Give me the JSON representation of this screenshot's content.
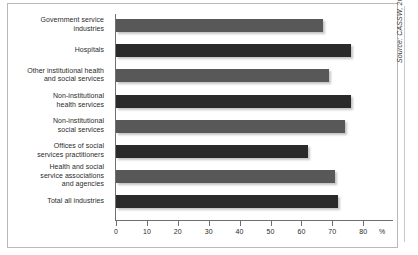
{
  "chart_data": {
    "type": "bar",
    "orientation": "horizontal",
    "title": "",
    "xlabel": "%",
    "ylabel": "",
    "xlim": [
      0,
      80
    ],
    "grid": false,
    "legend": null,
    "tick_labels": [
      "0",
      "10",
      "20",
      "30",
      "40",
      "50",
      "60",
      "70",
      "80"
    ],
    "tick_values": [
      0,
      10,
      20,
      30,
      40,
      50,
      60,
      70,
      80
    ],
    "axis_unit_symbol": "%",
    "categories": [
      "Government service industries",
      "Hospitals",
      "Other institutional health and social services",
      "Non-institutional health services",
      "Non-institutional social services",
      "Offices of social services practitioners",
      "Health and social service associations and agencies",
      "Total all industries"
    ],
    "category_lines": [
      [
        "Government service",
        "industries"
      ],
      [
        "Hospitals"
      ],
      [
        "Other institutional health",
        "and social services"
      ],
      [
        "Non-institutional",
        "health services"
      ],
      [
        "Non-institutional",
        "social services"
      ],
      [
        "Offices of social",
        "services practitioners"
      ],
      [
        "Health and social",
        "service associations",
        "and agencies"
      ],
      [
        "Total all industries"
      ]
    ],
    "values": [
      67,
      76,
      69,
      76,
      74,
      62,
      71,
      72
    ],
    "bar_shades": [
      "light",
      "dark",
      "light",
      "dark",
      "light",
      "dark",
      "light",
      "dark"
    ],
    "colors": {
      "light_bar": "#585858",
      "dark_bar": "#2a2a2a",
      "axis": "#6f6f6f",
      "text": "#2b2b2b",
      "frame": "#b9b9b9"
    }
  },
  "source": {
    "note": "Source: CASSW, 2001. In Critical Demand."
  }
}
